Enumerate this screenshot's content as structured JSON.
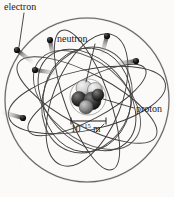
{
  "figure": {
    "background_color": "#fbfaf8",
    "ink_color": "#3a3a3a",
    "particle_color": "#141414",
    "width": 174,
    "height": 197
  },
  "labels": {
    "electron": "electron",
    "neutron": "neutron",
    "proton": "proton",
    "scale_mantissa": "10",
    "scale_exponent": "−15",
    "scale_unit": "m",
    "scale_full": "10−15 m"
  },
  "diagram": {
    "outer_sphere": {
      "cx": 87,
      "cy": 100,
      "r": 82,
      "name": "electron-cloud-boundary"
    },
    "nucleus": {
      "cx": 88,
      "cy": 97,
      "r": 17,
      "nucleons": [
        {
          "cx": 84,
          "cy": 88,
          "r": 8,
          "shade": "light"
        },
        {
          "cx": 95,
          "cy": 90,
          "r": 7.5,
          "shade": "light"
        },
        {
          "cx": 79,
          "cy": 99,
          "r": 7.5,
          "shade": "dark"
        },
        {
          "cx": 92,
          "cy": 101,
          "r": 9,
          "shade": "dark"
        },
        {
          "cx": 86,
          "cy": 106,
          "r": 7,
          "shade": "mid"
        },
        {
          "cx": 97,
          "cy": 96,
          "r": 6,
          "shade": "dark"
        }
      ]
    },
    "orbits": [
      {
        "cx": 87,
        "cy": 100,
        "rx": 80,
        "ry": 30,
        "rot": -12
      },
      {
        "cx": 87,
        "cy": 100,
        "rx": 78,
        "ry": 26,
        "rot": 28
      },
      {
        "cx": 87,
        "cy": 100,
        "rx": 74,
        "ry": 22,
        "rot": 70
      },
      {
        "cx": 87,
        "cy": 100,
        "rx": 70,
        "ry": 34,
        "rot": 112
      },
      {
        "cx": 87,
        "cy": 100,
        "rx": 66,
        "ry": 20,
        "rot": 152
      },
      {
        "cx": 87,
        "cy": 100,
        "rx": 58,
        "ry": 40,
        "rot": 48
      },
      {
        "cx": 87,
        "cy": 100,
        "rx": 52,
        "ry": 44,
        "rot": 95
      }
    ],
    "electrons": [
      {
        "cx": 17,
        "cy": 50,
        "r": 3.1,
        "trail_angle": 38,
        "name": "electron-upper-left"
      },
      {
        "cx": 50,
        "cy": 40,
        "r": 3.1,
        "trail_angle": 80,
        "name": "electron-top-left"
      },
      {
        "cx": 35,
        "cy": 70,
        "r": 3.1,
        "trail_angle": 8,
        "name": "electron-mid-left"
      },
      {
        "cx": 107,
        "cy": 36,
        "r": 3.1,
        "trail_angle": 105,
        "name": "electron-top-right"
      },
      {
        "cx": 136,
        "cy": 61,
        "r": 3.1,
        "trail_angle": 172,
        "name": "electron-right"
      },
      {
        "cx": 23,
        "cy": 118,
        "r": 3.1,
        "trail_angle": 196,
        "name": "electron-lower-left"
      }
    ],
    "scale_bar": {
      "x1": 71,
      "x2": 106,
      "y": 121,
      "tick_height": 6
    },
    "leaders": [
      {
        "from": [
          23,
          13
        ],
        "to": [
          19,
          47
        ],
        "name": "leader-electron"
      },
      {
        "from": [
          94,
          44
        ],
        "to": [
          86,
          83
        ],
        "name": "leader-neutron"
      },
      {
        "from": [
          134,
          108
        ],
        "to": [
          104,
          99
        ],
        "name": "leader-proton"
      }
    ]
  }
}
